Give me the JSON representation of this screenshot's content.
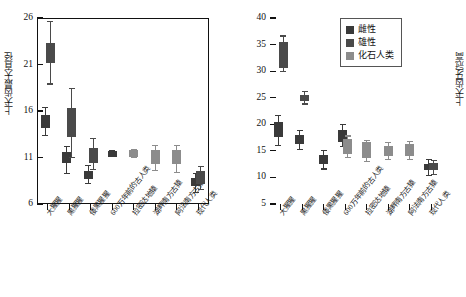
{
  "legend": {
    "position": "top-right-of-right-panel",
    "entries": [
      {
        "label": "雌性",
        "color": "#3a3a3a"
      },
      {
        "label": "雄性",
        "color": "#4a4a4a"
      },
      {
        "label": "化石人类",
        "color": "#8c8c8c"
      }
    ]
  },
  "chart_data": [
    {
      "id": "left",
      "type": "bar",
      "title": "",
      "xlabel": "",
      "ylabel": "上犬齿最大直径",
      "ylim": [
        6,
        26
      ],
      "yticks": [
        6,
        11,
        16,
        21,
        26
      ],
      "grid": false,
      "categories": [
        "大猩猩",
        "黑猩猩",
        "倭黑猩猩",
        "600万年前的古人类",
        "拉密达地猿",
        "湖畔南方古猿",
        "阿法南方古猿",
        "现代人类"
      ],
      "series": [
        {
          "name": "雌性",
          "color": "#3a3a3a",
          "boxes": [
            {
              "category": "大猩猩",
              "low": 13.4,
              "q1": 14.2,
              "q3": 15.6,
              "high": 16.4
            },
            {
              "category": "黑猩猩",
              "low": 9.3,
              "q1": 10.4,
              "q3": 11.6,
              "high": 12.2
            },
            {
              "category": "倭黑猩猩",
              "low": 8.2,
              "q1": 8.7,
              "q3": 9.6,
              "high": 10.1
            },
            {
              "category": "600万年前的古人类",
              "low": 11.1,
              "q1": 11.1,
              "q3": 11.7,
              "high": 11.7
            },
            {
              "category": "现代人类",
              "low": 7.2,
              "q1": 7.9,
              "q3": 8.8,
              "high": 9.3
            }
          ]
        },
        {
          "name": "雄性",
          "color": "#4a4a4a",
          "boxes": [
            {
              "category": "大猩猩",
              "low": 18.9,
              "q1": 21.2,
              "q3": 23.3,
              "high": 25.6
            },
            {
              "category": "黑猩猩",
              "low": 11.0,
              "q1": 13.2,
              "q3": 16.3,
              "high": 18.4
            },
            {
              "category": "倭黑猩猩",
              "low": 9.7,
              "q1": 10.4,
              "q3": 12.0,
              "high": 13.0
            },
            {
              "category": "现代人类",
              "low": 7.6,
              "q1": 8.2,
              "q3": 9.6,
              "high": 10.0
            }
          ]
        },
        {
          "name": "化石人类",
          "color": "#8c8c8c",
          "boxes": [
            {
              "category": "拉密达地猿",
              "low": 11.0,
              "q1": 11.0,
              "q3": 11.8,
              "high": 11.8
            },
            {
              "category": "湖畔南方古猿",
              "low": 9.6,
              "q1": 10.3,
              "q3": 11.8,
              "high": 12.3
            },
            {
              "category": "阿法南方古猿",
              "low": 9.4,
              "q1": 10.3,
              "q3": 11.8,
              "high": 12.3
            }
          ]
        }
      ]
    },
    {
      "id": "right",
      "type": "bar",
      "title": "",
      "xlabel": "",
      "ylabel": "上犬齿牙冠高",
      "ylim": [
        5,
        40
      ],
      "yticks": [
        5,
        10,
        15,
        20,
        25,
        30,
        35,
        40
      ],
      "grid": false,
      "categories": [
        "大猩猩",
        "黑猩猩",
        "倭黑猩猩",
        "600万年前的古人类",
        "拉密达地猿",
        "湖畔南方古猿",
        "阿法南方古猿",
        "现代人类"
      ],
      "series": [
        {
          "name": "雌性",
          "color": "#3a3a3a",
          "boxes": [
            {
              "category": "大猩猩",
              "low": 16.0,
              "q1": 17.6,
              "q3": 20.4,
              "high": 21.6
            },
            {
              "category": "黑猩猩",
              "low": 15.2,
              "q1": 16.2,
              "q3": 18.0,
              "high": 18.8
            },
            {
              "category": "倭黑猩猩",
              "low": 11.6,
              "q1": 12.5,
              "q3": 14.2,
              "high": 15.0
            },
            {
              "category": "600万年前的古人类",
              "low": 15.8,
              "q1": 16.6,
              "q3": 19.0,
              "high": 20.0
            },
            {
              "category": "现代人类",
              "low": 10.4,
              "q1": 11.4,
              "q3": 12.6,
              "high": 13.4
            }
          ]
        },
        {
          "name": "雄性",
          "color": "#4a4a4a",
          "boxes": [
            {
              "category": "大猩猩",
              "low": 30.0,
              "q1": 30.6,
              "q3": 35.4,
              "high": 36.6
            },
            {
              "category": "黑猩猩",
              "low": 23.8,
              "q1": 24.3,
              "q3": 25.6,
              "high": 26.2
            },
            {
              "category": "现代人类",
              "low": 10.6,
              "q1": 11.4,
              "q3": 12.8,
              "high": 13.2
            }
          ]
        },
        {
          "name": "化石人类",
          "color": "#8c8c8c",
          "boxes": [
            {
              "category": "拉密达地猿",
              "low": 13.0,
              "q1": 13.6,
              "q3": 16.6,
              "high": 17.0
            },
            {
              "category": "湖畔南方古猿",
              "low": 13.4,
              "q1": 14.0,
              "q3": 16.0,
              "high": 16.6
            },
            {
              "category": "阿法南方古猿",
              "low": 13.4,
              "q1": 14.0,
              "q3": 16.2,
              "high": 16.8
            },
            {
              "category": "600万年前的古人类",
              "low": 13.8,
              "q1": 14.4,
              "q3": 17.2,
              "high": 17.8
            }
          ]
        }
      ]
    }
  ]
}
